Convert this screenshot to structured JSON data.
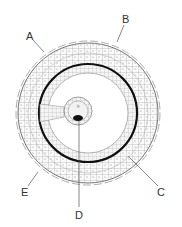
{
  "diagram": {
    "type": "embryo cross-section (blastocyst/chorionic vesicle)",
    "labels": [
      {
        "id": "A",
        "text": "A"
      },
      {
        "id": "B",
        "text": "B"
      },
      {
        "id": "C",
        "text": "C"
      },
      {
        "id": "D",
        "text": "D"
      },
      {
        "id": "E",
        "text": "E"
      }
    ]
  },
  "colors": {
    "line": "#555555",
    "ring": "#111111",
    "background": "#ffffff"
  }
}
